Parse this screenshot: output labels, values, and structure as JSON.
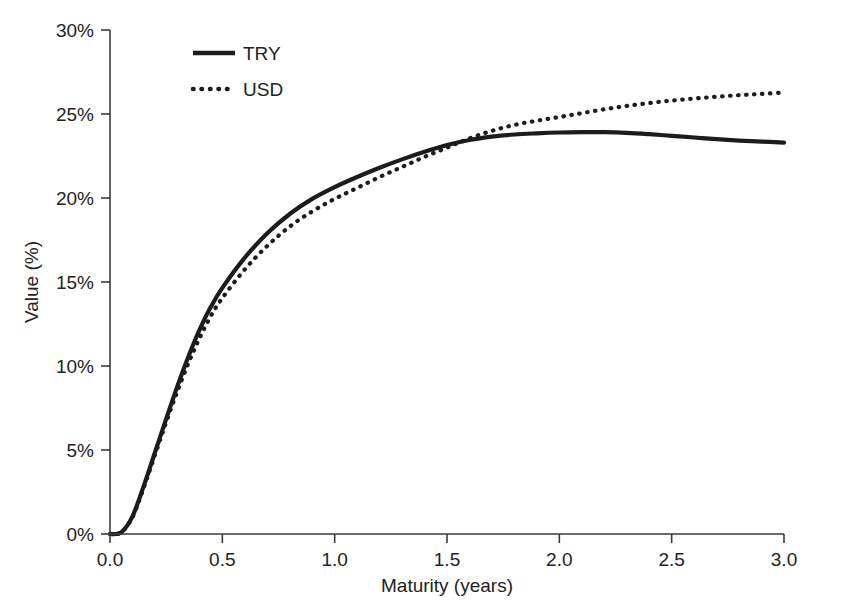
{
  "chart_data": {
    "type": "line",
    "title": "",
    "xlabel": "Maturity (years)",
    "ylabel": "Value (%)",
    "xlim": [
      0.0,
      3.0
    ],
    "ylim": [
      0,
      30
    ],
    "grid": false,
    "legend_position": "top-left-inside",
    "x_ticks": [
      "0.0",
      "0.5",
      "1.0",
      "1.5",
      "2.0",
      "2.5",
      "3.0"
    ],
    "x_tick_values": [
      0.0,
      0.5,
      1.0,
      1.5,
      2.0,
      2.5,
      3.0
    ],
    "y_ticks": [
      "0%",
      "5%",
      "10%",
      "15%",
      "20%",
      "25%",
      "30%"
    ],
    "y_tick_values": [
      0,
      5,
      10,
      15,
      20,
      25,
      30
    ],
    "x": [
      0.0,
      0.05,
      0.1,
      0.15,
      0.2,
      0.25,
      0.3,
      0.35,
      0.4,
      0.45,
      0.5,
      0.6,
      0.7,
      0.8,
      0.9,
      1.0,
      1.1,
      1.2,
      1.3,
      1.4,
      1.5,
      1.6,
      1.7,
      1.8,
      1.9,
      2.0,
      2.1,
      2.2,
      2.3,
      2.4,
      2.5,
      2.6,
      2.7,
      2.8,
      2.9,
      3.0
    ],
    "series": [
      {
        "name": "TRY",
        "style": "solid",
        "values": [
          0.0,
          0.1,
          1.05,
          2.85,
          4.85,
          6.85,
          8.8,
          10.6,
          12.2,
          13.55,
          14.65,
          16.45,
          17.9,
          19.05,
          19.95,
          20.65,
          21.25,
          21.8,
          22.3,
          22.75,
          23.15,
          23.45,
          23.65,
          23.78,
          23.85,
          23.9,
          23.92,
          23.92,
          23.88,
          23.8,
          23.7,
          23.6,
          23.5,
          23.42,
          23.36,
          23.3
        ]
      },
      {
        "name": "USD",
        "style": "dotted",
        "values": [
          0.0,
          0.1,
          1.0,
          2.75,
          4.7,
          6.65,
          8.5,
          10.2,
          11.7,
          13.0,
          14.05,
          15.75,
          17.15,
          18.3,
          19.2,
          19.95,
          20.6,
          21.25,
          21.85,
          22.45,
          23.0,
          23.55,
          24.0,
          24.35,
          24.6,
          24.82,
          25.05,
          25.28,
          25.48,
          25.65,
          25.8,
          25.92,
          26.03,
          26.12,
          26.2,
          26.28
        ]
      }
    ]
  },
  "legend": {
    "entries": [
      {
        "label": "TRY",
        "style": "solid"
      },
      {
        "label": "USD",
        "style": "dotted"
      }
    ]
  },
  "axes": {
    "y_title": "Value (%)",
    "x_title": "Maturity (years)"
  }
}
